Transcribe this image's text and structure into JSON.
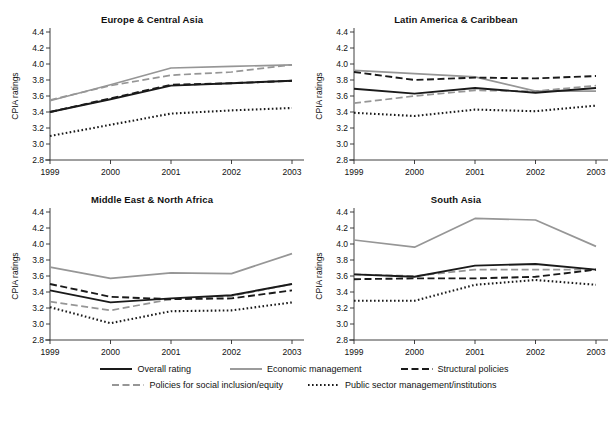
{
  "figure": {
    "y_axis_label": "CPIA ratings",
    "y_ticks": [
      "2.8",
      "3.0",
      "3.2",
      "3.4",
      "3.6",
      "3.8",
      "4.0",
      "4.2",
      "4.4"
    ],
    "x_ticks": [
      "1999",
      "2000",
      "2001",
      "2002",
      "2003"
    ]
  },
  "legend": {
    "items": [
      {
        "label": "Overall rating",
        "style": "solid",
        "color": "#1a1a1a"
      },
      {
        "label": "Economic management",
        "style": "solid",
        "color": "#969696"
      },
      {
        "label": "Structural policies",
        "style": "dashed",
        "color": "#1a1a1a"
      },
      {
        "label": "Policies for social inclusion/equity",
        "style": "dashed",
        "color": "#969696"
      },
      {
        "label": "Public sector management/institutions",
        "style": "dotted",
        "color": "#1a1a1a"
      }
    ]
  },
  "chart_data": [
    {
      "type": "line",
      "title": "Europe & Central Asia",
      "xlabel": "",
      "ylabel": "CPIA ratings",
      "x": [
        "1999",
        "2000",
        "2001",
        "2002",
        "2003"
      ],
      "ylim": [
        2.8,
        4.4
      ],
      "grid": false,
      "legend_position": "below-figure",
      "series": [
        {
          "name": "Overall rating",
          "style": "solid",
          "color": "#1a1a1a",
          "values": [
            3.4,
            3.56,
            3.73,
            3.76,
            3.79
          ]
        },
        {
          "name": "Economic management",
          "style": "solid",
          "color": "#969696",
          "values": [
            3.54,
            3.74,
            3.95,
            3.97,
            3.99
          ]
        },
        {
          "name": "Structural policies",
          "style": "dashed",
          "color": "#1a1a1a",
          "values": [
            3.4,
            3.57,
            3.74,
            3.76,
            3.79
          ]
        },
        {
          "name": "Policies for social inclusion/equity",
          "style": "dashed",
          "color": "#969696",
          "values": [
            3.55,
            3.73,
            3.86,
            3.9,
            3.99
          ]
        },
        {
          "name": "Public sector management/institutions",
          "style": "dotted",
          "color": "#1a1a1a",
          "values": [
            3.1,
            3.24,
            3.38,
            3.42,
            3.45
          ]
        }
      ]
    },
    {
      "type": "line",
      "title": "Latin America & Caribbean",
      "xlabel": "",
      "ylabel": "CPIA ratings",
      "x": [
        "1999",
        "2000",
        "2001",
        "2002",
        "2003"
      ],
      "ylim": [
        2.8,
        4.4
      ],
      "grid": false,
      "legend_position": "below-figure",
      "series": [
        {
          "name": "Overall rating",
          "style": "solid",
          "color": "#1a1a1a",
          "values": [
            3.69,
            3.63,
            3.7,
            3.64,
            3.7
          ]
        },
        {
          "name": "Economic management",
          "style": "solid",
          "color": "#969696",
          "values": [
            3.92,
            3.88,
            3.84,
            3.66,
            3.66
          ]
        },
        {
          "name": "Structural policies",
          "style": "dashed",
          "color": "#1a1a1a",
          "values": [
            3.9,
            3.8,
            3.83,
            3.82,
            3.85
          ]
        },
        {
          "name": "Policies for social inclusion/equity",
          "style": "dashed",
          "color": "#969696",
          "values": [
            3.51,
            3.6,
            3.67,
            3.66,
            3.73
          ]
        },
        {
          "name": "Public sector management/institutions",
          "style": "dotted",
          "color": "#1a1a1a",
          "values": [
            3.39,
            3.35,
            3.43,
            3.41,
            3.48
          ]
        }
      ]
    },
    {
      "type": "line",
      "title": "Middle East & North Africa",
      "xlabel": "",
      "ylabel": "CPIA ratings",
      "x": [
        "1999",
        "2000",
        "2001",
        "2002",
        "2003"
      ],
      "ylim": [
        2.8,
        4.4
      ],
      "grid": false,
      "legend_position": "below-figure",
      "series": [
        {
          "name": "Overall rating",
          "style": "solid",
          "color": "#1a1a1a",
          "values": [
            3.42,
            3.27,
            3.32,
            3.36,
            3.5
          ]
        },
        {
          "name": "Economic management",
          "style": "solid",
          "color": "#969696",
          "values": [
            3.71,
            3.57,
            3.64,
            3.63,
            3.88
          ]
        },
        {
          "name": "Structural policies",
          "style": "dashed",
          "color": "#1a1a1a",
          "values": [
            3.5,
            3.34,
            3.31,
            3.32,
            3.42
          ]
        },
        {
          "name": "Policies for social inclusion/equity",
          "style": "dashed",
          "color": "#969696",
          "values": [
            3.28,
            3.17,
            3.31,
            3.35,
            3.5
          ]
        },
        {
          "name": "Public sector management/institutions",
          "style": "dotted",
          "color": "#1a1a1a",
          "values": [
            3.21,
            3.01,
            3.16,
            3.17,
            3.27
          ]
        }
      ]
    },
    {
      "type": "line",
      "title": "South Asia",
      "xlabel": "",
      "ylabel": "CPIA ratings",
      "x": [
        "1999",
        "2000",
        "2001",
        "2002",
        "2003"
      ],
      "ylim": [
        2.8,
        4.4
      ],
      "grid": false,
      "legend_position": "below-figure",
      "series": [
        {
          "name": "Overall rating",
          "style": "solid",
          "color": "#1a1a1a",
          "values": [
            3.62,
            3.59,
            3.73,
            3.75,
            3.68
          ]
        },
        {
          "name": "Economic management",
          "style": "solid",
          "color": "#969696",
          "values": [
            4.05,
            3.96,
            4.32,
            4.3,
            3.97
          ]
        },
        {
          "name": "Structural policies",
          "style": "dashed",
          "color": "#1a1a1a",
          "values": [
            3.56,
            3.57,
            3.57,
            3.59,
            3.68
          ]
        },
        {
          "name": "Policies for social inclusion/equity",
          "style": "dashed",
          "color": "#969696",
          "values": [
            3.62,
            3.6,
            3.68,
            3.68,
            3.68
          ]
        },
        {
          "name": "Public sector management/institutions",
          "style": "dotted",
          "color": "#1a1a1a",
          "values": [
            3.29,
            3.29,
            3.49,
            3.55,
            3.49
          ]
        }
      ]
    }
  ]
}
